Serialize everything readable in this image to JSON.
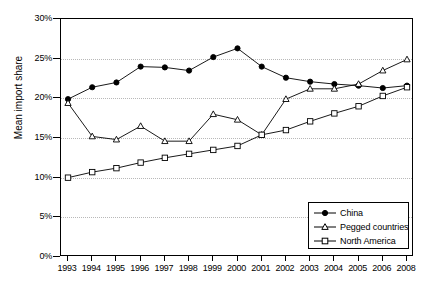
{
  "chart_data": {
    "type": "line",
    "title": "",
    "xlabel": "",
    "ylabel": "Mean import share",
    "ylim": [
      0,
      30
    ],
    "ytick_labels": [
      "0%",
      "5%",
      "10%",
      "15%",
      "20%",
      "25%",
      "30%"
    ],
    "ytick_values": [
      0,
      5,
      10,
      15,
      20,
      25,
      30
    ],
    "grid": true,
    "legend_position": "bottom-right",
    "categories": [
      "1993",
      "1994",
      "1995",
      "1996",
      "1997",
      "1998",
      "1999",
      "2000",
      "2001",
      "2002",
      "2003",
      "2004",
      "2005",
      "2006",
      "2008"
    ],
    "series": [
      {
        "name": "China",
        "marker": "filled-circle",
        "values": [
          19.9,
          21.4,
          22.0,
          24.0,
          23.9,
          23.5,
          25.2,
          26.3,
          24.0,
          22.6,
          22.1,
          21.8,
          21.6,
          21.3,
          21.6
        ]
      },
      {
        "name": "Pegged countries",
        "marker": "open-triangle",
        "values": [
          19.4,
          15.2,
          14.8,
          16.5,
          14.6,
          14.6,
          18.0,
          17.3,
          15.4,
          19.9,
          21.2,
          21.2,
          21.8,
          23.5,
          24.9
        ]
      },
      {
        "name": "North America",
        "marker": "open-square",
        "values": [
          10.0,
          10.7,
          11.2,
          11.9,
          12.5,
          13.0,
          13.5,
          14.0,
          15.4,
          16.0,
          17.1,
          18.1,
          19.0,
          20.3,
          21.4
        ]
      }
    ]
  },
  "legend": {
    "items": [
      {
        "label": "China",
        "marker": "filled-circle"
      },
      {
        "label": "Pegged countries",
        "marker": "open-triangle"
      },
      {
        "label": "North America",
        "marker": "open-square"
      }
    ]
  },
  "colors": {
    "line": "#000000",
    "grid": "#b8b8b8",
    "axis": "#000000",
    "background": "#ffffff"
  }
}
